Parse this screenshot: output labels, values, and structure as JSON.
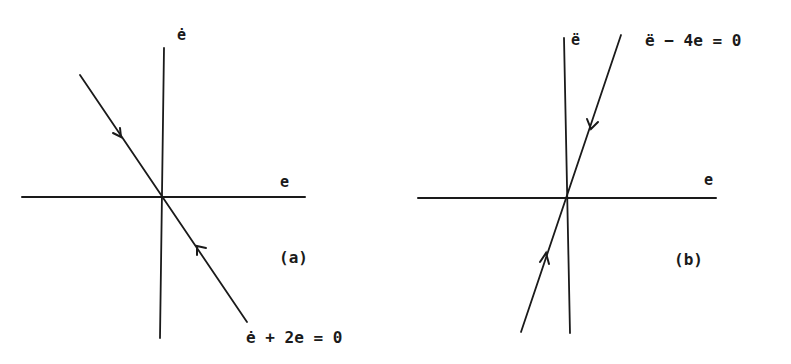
{
  "figure": {
    "panels": [
      {
        "id": "a",
        "caption": "(a)",
        "x_axis_label": "e",
        "y_axis_label": "ė",
        "line_equation": "ė + 2e = 0",
        "slope": -2,
        "trajectory_direction": "toward origin (stable)"
      },
      {
        "id": "b",
        "caption": "(b)",
        "x_axis_label": "e",
        "y_axis_label": "ë",
        "line_equation": "ë − 4e = 0",
        "slope": 4,
        "trajectory_direction": "toward origin along line"
      }
    ]
  },
  "colors": {
    "ink": "#1a1a1a",
    "background": "#ffffff"
  }
}
